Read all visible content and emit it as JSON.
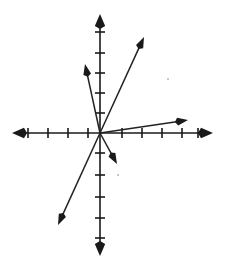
{
  "figure": {
    "type": "line-diagram",
    "width": 226,
    "height": 263,
    "background_color": "#ffffff",
    "ink_color": "#1a1a1a"
  },
  "chart_data": {
    "type": "scatter",
    "xlabel": "",
    "ylabel": "",
    "grid": false,
    "legend": false,
    "origin_px": {
      "x": 100,
      "y": 133
    },
    "unit_px": 20,
    "xlim": [
      -4.4,
      5.65
    ],
    "ylim": [
      -6.15,
      5.95
    ],
    "axes": {
      "x_axis": {
        "label": "x-axis",
        "start_px": {
          "x": 12,
          "y": 133
        },
        "end_px": {
          "x": 213,
          "y": 133
        },
        "arrows": "both",
        "tick_count": 10,
        "ticks_px": [
          28,
          48,
          68,
          88,
          122,
          142,
          162,
          182,
          198
        ],
        "tick_half_len_px": 5
      },
      "y_axis": {
        "label": "y-axis",
        "start_px": {
          "x": 100,
          "y": 14
        },
        "end_px": {
          "x": 100,
          "y": 256
        },
        "arrows": "both",
        "tick_count": 10,
        "ticks_px": [
          32,
          53,
          73,
          93,
          113,
          153,
          175,
          197,
          218,
          238
        ],
        "tick_half_len_px": 5
      }
    },
    "rays": [
      {
        "name": "ray-upper-left-steep",
        "from_px": {
          "x": 100,
          "y": 133
        },
        "to_px": {
          "x": 85,
          "y": 64
        },
        "slope": 4.6,
        "direction_deg": 102.3,
        "quadrant": "II"
      },
      {
        "name": "ray-upper-right-steep",
        "from_px": {
          "x": 100,
          "y": 133
        },
        "to_px": {
          "x": 144,
          "y": 37
        },
        "slope": 2.18,
        "direction_deg": 65.4,
        "quadrant": "I"
      },
      {
        "name": "ray-right-shallow",
        "from_px": {
          "x": 100,
          "y": 133
        },
        "to_px": {
          "x": 188,
          "y": 120
        },
        "slope": 0.15,
        "direction_deg": 8.4,
        "quadrant": "I"
      },
      {
        "name": "ray-lower-right-short",
        "from_px": {
          "x": 100,
          "y": 133
        },
        "to_px": {
          "x": 117,
          "y": 164
        },
        "slope": -1.82,
        "direction_deg": -61.3,
        "quadrant": "IV"
      },
      {
        "name": "ray-lower-left-long",
        "from_px": {
          "x": 100,
          "y": 133
        },
        "to_px": {
          "x": 58,
          "y": 225
        },
        "slope": -2.19,
        "direction_deg": -114.5,
        "quadrant": "III"
      }
    ],
    "specks": [
      {
        "x": 168,
        "y": 79,
        "r": 1.1
      },
      {
        "x": 118,
        "y": 175,
        "r": 1.1
      }
    ]
  }
}
